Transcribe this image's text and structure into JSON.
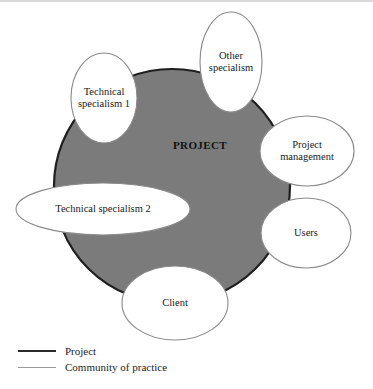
{
  "figure": {
    "core": {
      "label": "PROJECT",
      "fill_color": "#7b7b7b",
      "stroke_color": "#1f1f1f"
    },
    "nodes": [
      {
        "id": "technical-specialism-1",
        "label": "Technical\nspecialism 1"
      },
      {
        "id": "other-specialism",
        "label": "Other\nspecialism"
      },
      {
        "id": "project-management",
        "label": "Project\nmanagement"
      },
      {
        "id": "users",
        "label": "Users"
      },
      {
        "id": "technical-specialism-2",
        "label": "Technical specialism 2"
      },
      {
        "id": "client",
        "label": "Client"
      }
    ],
    "node_fill_color": "#ffffff",
    "node_stroke_color": "#8a8a8a"
  },
  "legend": {
    "items": [
      {
        "id": "project",
        "label": "Project",
        "style": "thick",
        "color": "#2b2b2b"
      },
      {
        "id": "community-of-practice",
        "label": "Community of practice",
        "style": "thin",
        "color": "#9a9a9a"
      }
    ]
  }
}
